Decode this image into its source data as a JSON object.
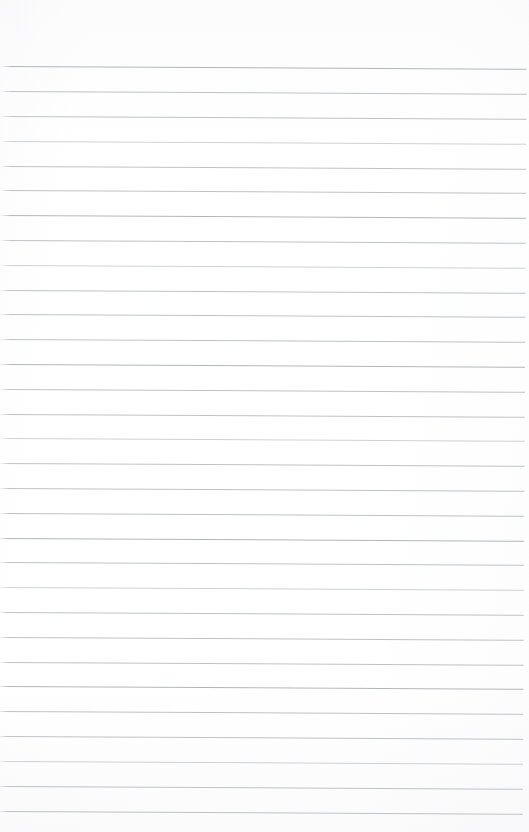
{
  "document": {
    "kind": "lined-notepad-paper",
    "title": "Blank ruled notepad page",
    "content_text": "",
    "page_width": 529,
    "page_height": 832,
    "background_color": "#fdfdfd",
    "rule_color": "#b9bdc2",
    "rule_thickness_px": 1,
    "rule_spacing_px": 24.9,
    "rule_skew_degrees": 0.3,
    "top_margin_px": 66,
    "bottom_margin_px": 20,
    "left_inset_px": 2,
    "right_inset_px": 2,
    "rule_count": 31,
    "rule_y_positions": [
      66,
      91,
      116,
      141,
      166,
      190,
      215,
      240,
      265,
      290,
      314,
      339,
      364,
      389,
      414,
      438,
      463,
      488,
      513,
      538,
      562,
      587,
      612,
      637,
      662,
      686,
      711,
      736,
      761,
      786,
      811
    ],
    "rule_weights": [
      "strong",
      "normal",
      "normal",
      "faint",
      "normal",
      "normal",
      "strong",
      "normal",
      "faint",
      "normal",
      "normal",
      "normal",
      "strong",
      "normal",
      "normal",
      "faint",
      "normal",
      "normal",
      "normal",
      "strong",
      "normal",
      "faint",
      "normal",
      "normal",
      "normal",
      "strong",
      "normal",
      "normal",
      "faint",
      "normal",
      "normal"
    ]
  }
}
